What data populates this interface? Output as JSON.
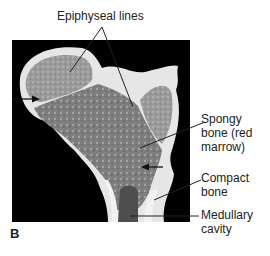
{
  "figure": {
    "panel_letter": "B",
    "labels": {
      "epiphyseal_lines": "Epiphyseal lines",
      "spongy_bone": "Spongy\nbone (red\nmarrow)",
      "compact_bone": "Compact\nbone",
      "medullary_cavity": "Medullary\ncavity"
    },
    "colors": {
      "background": "#ffffff",
      "photo_background": "#000000",
      "bone_light": "#e8e8e8",
      "spongy_gray": "#8a8a8a",
      "text": "#222222"
    }
  }
}
